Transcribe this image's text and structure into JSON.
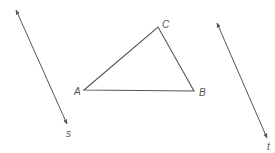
{
  "diagram": {
    "colors": {
      "stroke": "#555555",
      "label": "#555555",
      "background": "#ffffff"
    },
    "triangle": {
      "vertices": [
        {
          "name": "A",
          "x": 84,
          "y": 90,
          "label_x": 74,
          "label_y": 95
        },
        {
          "name": "B",
          "x": 194,
          "y": 91,
          "label_x": 199,
          "label_y": 96
        },
        {
          "name": "C",
          "x": 158,
          "y": 27,
          "label_x": 162,
          "label_y": 28
        }
      ]
    },
    "lines": [
      {
        "name": "s",
        "x1": 16,
        "y1": 10,
        "x2": 67,
        "y2": 124,
        "label_x": 66,
        "label_y": 137
      },
      {
        "name": "t",
        "x1": 217,
        "y1": 23,
        "x2": 267,
        "y2": 138,
        "label_x": 267,
        "label_y": 150
      }
    ]
  }
}
